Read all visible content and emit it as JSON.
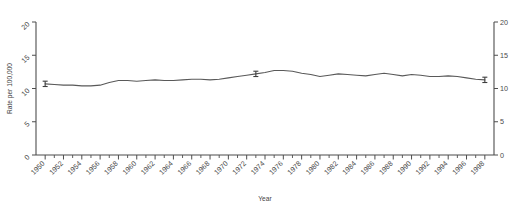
{
  "chart_data": {
    "type": "line",
    "title": "",
    "subtitle": "",
    "xlabel": "Year",
    "ylabel": "Rate per 100,000",
    "ylabel_right": "Rate per 100,000",
    "xlim": [
      1949,
      1999
    ],
    "ylim": [
      0,
      20
    ],
    "yticks": [
      0,
      5,
      10,
      15,
      20
    ],
    "yticks_right": [
      0,
      5,
      10,
      15,
      20
    ],
    "xticks": [
      1950,
      1952,
      1954,
      1956,
      1958,
      1960,
      1962,
      1964,
      1966,
      1968,
      1970,
      1972,
      1974,
      1976,
      1978,
      1980,
      1982,
      1984,
      1986,
      1988,
      1990,
      1992,
      1994,
      1996,
      1998
    ],
    "xtick_labels": [
      "1950",
      "1952",
      "1954",
      "1956",
      "1958",
      "1960",
      "1962",
      "1964",
      "1966",
      "1968",
      "1970",
      "1972",
      "1974",
      "1976",
      "1978",
      "1980",
      "1982",
      "1984",
      "1986",
      "1988",
      "1990",
      "1992",
      "1994",
      "1996",
      "1998"
    ],
    "grid": false,
    "legend": false,
    "legend_position": "none",
    "line_color": "#595959",
    "axis_color": "#4d4d4d",
    "x": [
      1950,
      1951,
      1952,
      1953,
      1954,
      1955,
      1956,
      1957,
      1958,
      1959,
      1960,
      1961,
      1962,
      1963,
      1964,
      1965,
      1966,
      1967,
      1968,
      1969,
      1970,
      1971,
      1972,
      1973,
      1974,
      1975,
      1976,
      1977,
      1978,
      1979,
      1980,
      1981,
      1982,
      1983,
      1984,
      1985,
      1986,
      1987,
      1988,
      1989,
      1990,
      1991,
      1992,
      1993,
      1994,
      1995,
      1996,
      1997,
      1998
    ],
    "values": [
      10.7,
      10.6,
      10.5,
      10.5,
      10.4,
      10.4,
      10.5,
      10.9,
      11.2,
      11.2,
      11.1,
      11.2,
      11.3,
      11.2,
      11.2,
      11.3,
      11.4,
      11.4,
      11.3,
      11.4,
      11.6,
      11.8,
      12.0,
      12.2,
      12.4,
      12.7,
      12.7,
      12.6,
      12.3,
      12.1,
      11.8,
      12.0,
      12.2,
      12.1,
      12.0,
      11.9,
      12.1,
      12.3,
      12.1,
      11.9,
      12.1,
      12.0,
      11.8,
      11.8,
      11.9,
      11.8,
      11.6,
      11.4,
      11.3
    ],
    "error_bars": [
      {
        "x": 1950,
        "y": 10.7,
        "low": 10.3,
        "high": 11.1
      },
      {
        "x": 1973,
        "y": 12.2,
        "low": 11.8,
        "high": 12.6
      },
      {
        "x": 1998,
        "y": 11.3,
        "low": 10.9,
        "high": 11.7
      }
    ]
  }
}
